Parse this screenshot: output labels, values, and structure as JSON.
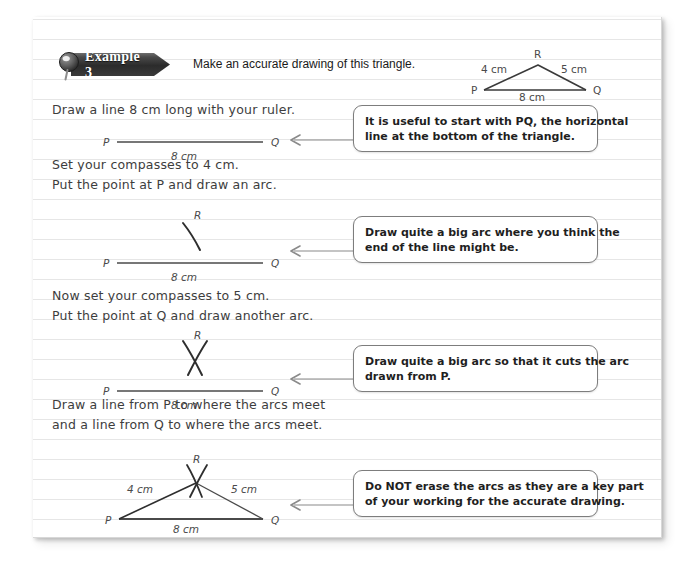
{
  "banner": {
    "label": "Example 3",
    "pin_icon": "magnifier-pin-icon"
  },
  "prompt": "Make an accurate drawing of this triangle.",
  "header_triangle": {
    "vertex_p": "P",
    "vertex_q": "Q",
    "vertex_r": "R",
    "side_pr": "4 cm",
    "side_rq": "5 cm",
    "side_pq": "8 cm"
  },
  "steps": [
    {
      "id": "step-1",
      "lines": [
        "Draw a line 8 cm long with your ruler."
      ],
      "figure": {
        "p": "P",
        "q": "Q",
        "base": "8 cm"
      },
      "callout": [
        "It is useful to start with PQ, the horizontal",
        "line at the bottom of the triangle."
      ]
    },
    {
      "id": "step-2",
      "lines": [
        "Set your compasses to 4 cm.",
        "Put the point at P and draw an arc."
      ],
      "figure": {
        "p": "P",
        "q": "Q",
        "r": "R",
        "base": "8 cm"
      },
      "callout": [
        "Draw quite a big arc where you think the",
        "end of the line might be."
      ]
    },
    {
      "id": "step-3",
      "lines": [
        "Now set your compasses to 5 cm.",
        "Put the point at Q and draw another arc."
      ],
      "figure": {
        "p": "P",
        "q": "Q",
        "r": "R",
        "base": "8 cm"
      },
      "callout": [
        "Draw quite a big arc so that it cuts the arc",
        "drawn from P."
      ]
    },
    {
      "id": "step-4",
      "lines": [
        "Draw a line from P to where the arcs meet",
        "and a line from Q to where the arcs meet."
      ],
      "figure": {
        "p": "P",
        "q": "Q",
        "r": "R",
        "side_pr": "4 cm",
        "side_rq": "5 cm",
        "base": "8 cm"
      },
      "callout": [
        "Do NOT erase the arcs as they are a key part",
        "of your working for the accurate drawing."
      ]
    }
  ],
  "colors": {
    "ink": "#3d3d3d",
    "rule_line": "#e6e6e6",
    "callout_border": "#7d7d7d",
    "banner_dark": "#2b2b2b",
    "arrow": "#8a8a8a"
  }
}
